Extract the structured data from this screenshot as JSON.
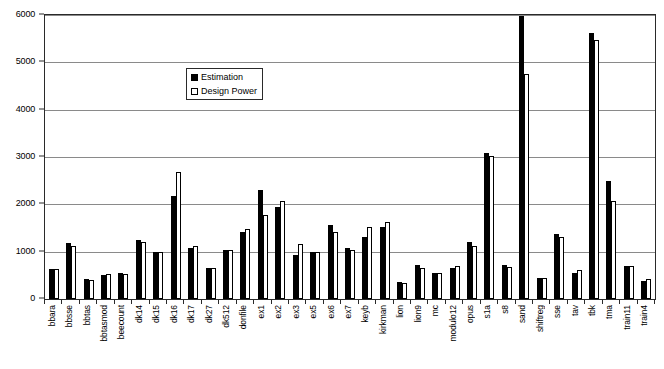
{
  "chart_data": {
    "type": "bar",
    "title": "",
    "xlabel": "",
    "ylabel": "",
    "ylim": [
      0,
      6000
    ],
    "ytick_step": 1000,
    "yticks": [
      "0",
      "1000",
      "2000",
      "3000",
      "4000",
      "5000",
      "6000"
    ],
    "grid": true,
    "legend_position": "inside-top-center",
    "categories": [
      "bbara",
      "bbsse",
      "bbtas",
      "bbtasmod",
      "beecount",
      "dk14",
      "dk15",
      "dk16",
      "dk17",
      "dk27",
      "dk512",
      "donfile",
      "ex1",
      "ex2",
      "ex3",
      "ex5",
      "ex6",
      "ex7",
      "keyb",
      "kirkman",
      "lion",
      "lion9",
      "mc",
      "modulo12",
      "opus",
      "s1a",
      "s8",
      "sand",
      "shiftreg",
      "sse",
      "tav",
      "tbk",
      "tma",
      "train11",
      "train4"
    ],
    "series": [
      {
        "name": "Estimation",
        "color": "#000000",
        "style": "filled",
        "values": [
          630,
          1180,
          430,
          510,
          540,
          1240,
          990,
          2170,
          1080,
          650,
          1030,
          1420,
          2310,
          1950,
          920,
          990,
          1560,
          1070,
          1320,
          1520,
          370,
          710,
          540,
          650,
          1200,
          3080,
          720,
          5970,
          440,
          1380,
          560,
          5620,
          2500,
          690,
          390
        ]
      },
      {
        "name": "Design Power",
        "color": "#ffffff",
        "style": "hollow",
        "values": [
          640,
          1120,
          400,
          520,
          530,
          1200,
          1000,
          2680,
          1120,
          650,
          1030,
          1470,
          1780,
          2080,
          1170,
          1000,
          1420,
          1030,
          1520,
          1620,
          330,
          650,
          550,
          690,
          1110,
          3030,
          680,
          4750,
          440,
          1300,
          620,
          5470,
          2070,
          690,
          430
        ]
      }
    ]
  },
  "legend": {
    "entries": [
      {
        "label": "Estimation",
        "swatch": "filled-square-icon"
      },
      {
        "label": "Design Power",
        "swatch": "hollow-square-icon"
      }
    ]
  },
  "colors": {
    "estimation": "#000000",
    "design_power": "#ffffff",
    "axis": "#2a2a2a",
    "grid": "#8a8a8a",
    "background": "#ffffff"
  }
}
